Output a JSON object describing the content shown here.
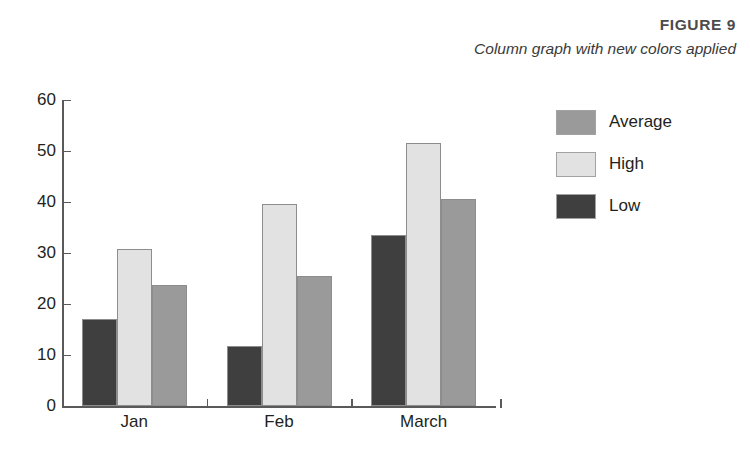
{
  "figure": {
    "number_label": "FIGURE 9",
    "caption": "Column graph with new colors applied"
  },
  "chart_data": {
    "type": "bar",
    "title": "Column graph with new colors applied",
    "xlabel": "",
    "ylabel": "",
    "categories": [
      "Jan",
      "Feb",
      "March"
    ],
    "series": [
      {
        "name": "Low",
        "color": "#3f3f3f",
        "values": [
          17,
          11.8,
          33.5
        ]
      },
      {
        "name": "High",
        "color": "#e2e2e2",
        "values": [
          30.8,
          39.6,
          51.5
        ]
      },
      {
        "name": "Average",
        "color": "#9a9a9a",
        "values": [
          23.8,
          25.5,
          40.5
        ]
      }
    ],
    "legend_order": [
      "Average",
      "High",
      "Low"
    ],
    "legend_position": "right",
    "ylim": [
      0,
      60
    ],
    "yticks": [
      0,
      10,
      20,
      30,
      40,
      50,
      60
    ],
    "ytick_labels": [
      "0",
      "10",
      "20",
      "30",
      "40",
      "50",
      "60"
    ],
    "grid": false
  },
  "colors": {
    "axis": "#5a5a5a",
    "text": "#231f20",
    "background": "#ffffff",
    "bar_low": "#3f3f3f",
    "bar_high": "#e2e2e2",
    "bar_average": "#9a9a9a"
  }
}
